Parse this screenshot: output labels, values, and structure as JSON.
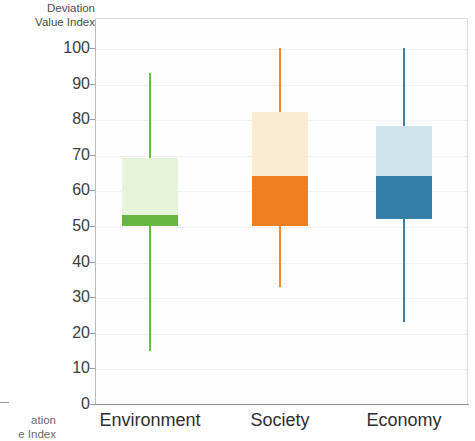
{
  "chart_data": {
    "type": "box",
    "title": "",
    "xlabel": "",
    "ylabel": "Deviation\nValue Index",
    "ylim": [
      0,
      100
    ],
    "ytick_labels": [
      "100",
      "90",
      "80",
      "70",
      "60",
      "50",
      "40",
      "30",
      "20",
      "10",
      "0"
    ],
    "ytick_values": [
      100,
      90,
      80,
      70,
      60,
      50,
      40,
      30,
      20,
      10,
      0
    ],
    "grid": true,
    "legend": "none",
    "categories": [
      "Environment",
      "Society",
      "Economy"
    ],
    "series": [
      {
        "name": "Environment",
        "color_box_upper": "#e8f4d9",
        "color_box_lower": "#66b63f",
        "color_whisker": "#69bb41",
        "whisker_high": 93,
        "q3": 69,
        "median": 53,
        "q1": 50,
        "whisker_low": 15
      },
      {
        "name": "Society",
        "color_box_upper": "#faecd2",
        "color_box_lower": "#ef8022",
        "color_whisker": "#f08a2c",
        "whisker_high": 100,
        "q3": 82,
        "median": 64,
        "q1": 50,
        "whisker_low": 33
      },
      {
        "name": "Economy",
        "color_box_upper": "#cfe3ed",
        "color_box_lower": "#337fa5",
        "color_whisker": "#3b82a8",
        "whisker_high": 100,
        "q3": 78,
        "median": 64,
        "q1": 52,
        "whisker_low": 23
      }
    ]
  },
  "axis": {
    "y_title": "Deviation\nValue Index",
    "cropped_neighbor_label": "ation\ne Index"
  }
}
